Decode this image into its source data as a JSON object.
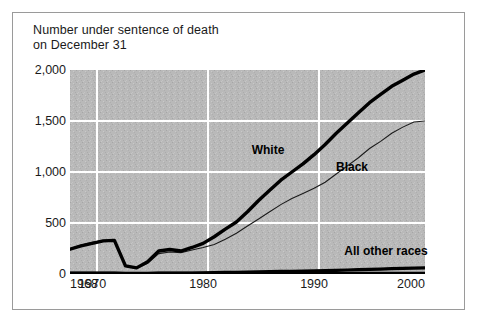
{
  "title": "Number under sentence of death\non December 31",
  "colors": {
    "plot_fill": "#b8b8b8",
    "gridline": "#ffffff",
    "line": "#000000",
    "frame_border": "#9a9a9a",
    "text": "#1a1a1a"
  },
  "axes": {
    "y_ticks": [
      "2,000",
      "1,500",
      "1,000",
      "500",
      "0"
    ],
    "x_ticks": [
      "1968",
      "1970",
      "1980",
      "1990",
      "2000"
    ]
  },
  "series_labels": {
    "white": "White",
    "black": "Black",
    "other": "All other races"
  },
  "chart_data": {
    "type": "line",
    "title": "Number under sentence of death on December 31",
    "xlabel": "",
    "ylabel": "",
    "xlim": [
      1968,
      2000
    ],
    "ylim": [
      0,
      2000
    ],
    "grid": true,
    "legend": "inline-annotations",
    "x": [
      1968,
      1969,
      1970,
      1971,
      1972,
      1973,
      1974,
      1975,
      1976,
      1977,
      1978,
      1979,
      1980,
      1981,
      1982,
      1983,
      1984,
      1985,
      1986,
      1987,
      1988,
      1989,
      1990,
      1991,
      1992,
      1993,
      1994,
      1995,
      1996,
      1997,
      1998,
      1999,
      2000
    ],
    "series": [
      {
        "name": "White",
        "label": "White",
        "style": "thick",
        "values": [
          243,
          275,
          300,
          325,
          330,
          80,
          60,
          120,
          225,
          240,
          225,
          260,
          300,
          365,
          440,
          510,
          610,
          720,
          820,
          920,
          1000,
          1080,
          1170,
          1270,
          1380,
          1480,
          1580,
          1680,
          1760,
          1840,
          1900,
          1960,
          2000
        ]
      },
      {
        "name": "Black",
        "label": "Black",
        "style": "thin",
        "values": [
          250,
          285,
          310,
          330,
          330,
          75,
          55,
          105,
          200,
          215,
          210,
          235,
          260,
          290,
          340,
          400,
          470,
          540,
          610,
          680,
          740,
          790,
          840,
          900,
          980,
          1060,
          1140,
          1230,
          1300,
          1380,
          1440,
          1490,
          1500
        ]
      },
      {
        "name": "All other races",
        "label": "All other races",
        "style": "thick",
        "values": [
          8,
          8,
          9,
          9,
          10,
          3,
          2,
          4,
          8,
          9,
          9,
          10,
          11,
          13,
          15,
          17,
          19,
          21,
          23,
          25,
          27,
          29,
          31,
          33,
          36,
          39,
          42,
          45,
          48,
          52,
          55,
          58,
          60
        ]
      }
    ],
    "annotations": [
      {
        "text": "White",
        "x": 1986,
        "y": 1120
      },
      {
        "text": "Black",
        "x": 1993,
        "y": 1030
      },
      {
        "text": "All other races",
        "x": 1996,
        "y": 230
      }
    ]
  }
}
